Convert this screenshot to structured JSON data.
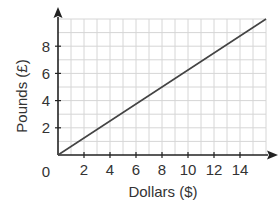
{
  "chart_data": {
    "type": "line",
    "title": "",
    "xlabel": "Dollars ($)",
    "ylabel": "Pounds (£)",
    "xlim": [
      0,
      16
    ],
    "ylim": [
      0,
      10
    ],
    "x_ticks": [
      2,
      4,
      6,
      8,
      10,
      12,
      14
    ],
    "y_ticks": [
      2,
      4,
      6,
      8
    ],
    "origin_label": "0",
    "grid": true,
    "grid_step": 1,
    "legend": null,
    "series": [
      {
        "name": "Dollars to Pounds",
        "x": [
          0,
          16
        ],
        "y": [
          0,
          10
        ]
      }
    ]
  },
  "colors": {
    "axis": "#222222",
    "grid": "#d6d6d6",
    "line": "#444444",
    "text": "#333333"
  }
}
